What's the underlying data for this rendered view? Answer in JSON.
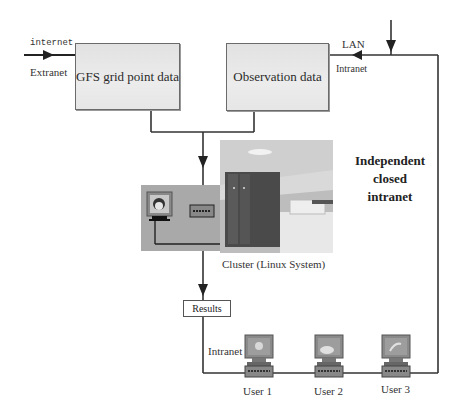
{
  "diagram": {
    "nodes": {
      "gfs": {
        "label": "GFS grid point data"
      },
      "observation": {
        "label": "Observation data"
      },
      "cluster": {
        "label": "Cluster (Linux System)"
      },
      "results": {
        "label": "Results"
      }
    },
    "edge_labels": {
      "internet": "internet",
      "extranet": "Extranet",
      "lan": "LAN",
      "intranet_top": "Intranet",
      "intranet_bottom": "Intranet"
    },
    "note": {
      "line1": "Independent",
      "line2": "closed",
      "line3": "intranet"
    },
    "users": [
      {
        "label": "User 1"
      },
      {
        "label": "User 2"
      },
      {
        "label": "User 3"
      }
    ],
    "colors": {
      "line": "#2b2b2b",
      "box_fill": "#e6e6e6",
      "panel_fill": "#a9a9a9",
      "terminal_screen": "#7d7d7d"
    }
  }
}
